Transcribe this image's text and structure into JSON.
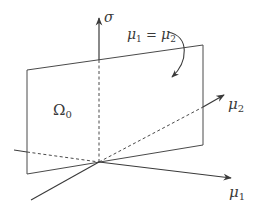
{
  "diagram": {
    "type": "3d-axes-with-plane",
    "colors": {
      "line": "#3a3a3a",
      "background": "#ffffff"
    },
    "axes": {
      "sigma": {
        "symbol": "σ"
      },
      "mu1": {
        "symbol": "μ",
        "subscript": "1"
      },
      "mu2": {
        "symbol": "μ",
        "subscript": "2"
      }
    },
    "plane": {
      "label": "Ω",
      "label_subscript": "0"
    },
    "annotation": {
      "left_symbol": "μ",
      "left_subscript": "1",
      "equals": " = ",
      "right_symbol": "μ",
      "right_subscript": "2"
    }
  }
}
